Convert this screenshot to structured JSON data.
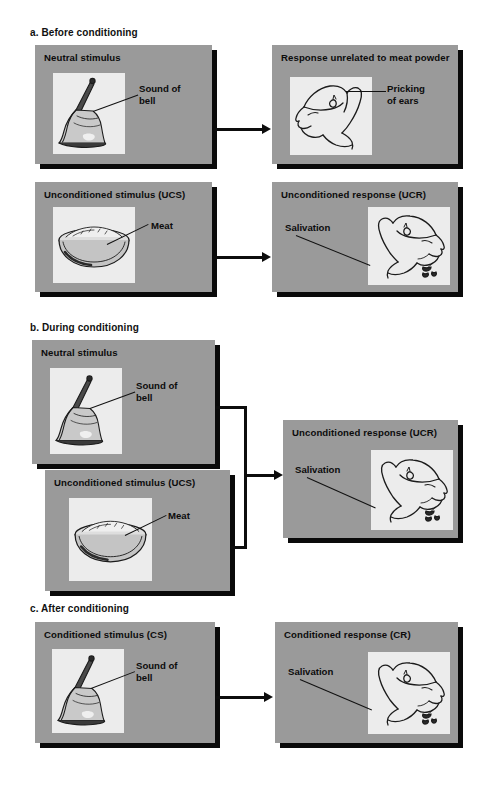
{
  "figure": {
    "panel_color": "#9a9a9a",
    "plate_color": "#ececec",
    "ink_color": "#111111",
    "background": "#ffffff"
  },
  "sections": [
    {
      "id": "a",
      "heading": "a. Before conditioning",
      "panels": [
        {
          "id": "a-ns",
          "title": "Neutral stimulus",
          "illustration": "bell-illustration",
          "callout": "Sound of\nbell"
        },
        {
          "id": "a-resp",
          "title": "Response unrelated to\nmeat powder",
          "illustration": "dog-head-alert-illustration",
          "callout": "Pricking\nof ears"
        },
        {
          "id": "a-ucs",
          "title": "Unconditioned stimulus (UCS)",
          "illustration": "meat-bowl-illustration",
          "callout": "Meat"
        },
        {
          "id": "a-ucr",
          "title": "Unconditioned response (UCR)",
          "illustration": "dog-head-salivating-illustration",
          "callout": "Salivation"
        }
      ]
    },
    {
      "id": "b",
      "heading": "b. During conditioning",
      "panels": [
        {
          "id": "b-ns",
          "title": "Neutral stimulus",
          "illustration": "bell-illustration",
          "callout": "Sound of\nbell"
        },
        {
          "id": "b-ucs",
          "title": "Unconditioned stimulus (UCS)",
          "illustration": "meat-bowl-illustration",
          "callout": "Meat"
        },
        {
          "id": "b-ucr",
          "title": "Unconditioned response (UCR)",
          "illustration": "dog-head-salivating-illustration",
          "callout": "Salivation"
        }
      ]
    },
    {
      "id": "c",
      "heading": "c. After conditioning",
      "panels": [
        {
          "id": "c-cs",
          "title": "Conditioned stimulus (CS)",
          "illustration": "bell-illustration",
          "callout": "Sound of\nbell"
        },
        {
          "id": "c-cr",
          "title": "Conditioned response (CR)",
          "illustration": "dog-head-salivating-illustration",
          "callout": "Salivation"
        }
      ]
    }
  ]
}
